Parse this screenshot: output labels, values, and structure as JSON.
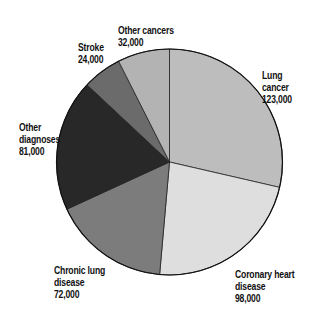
{
  "chart_data": {
    "type": "pie",
    "title": "",
    "start_angle_deg": 0,
    "direction": "clockwise",
    "total": 430000,
    "slices": [
      {
        "label": "Lung cancer",
        "value": 123000,
        "value_label": "123,000",
        "color": "#bdbdbd"
      },
      {
        "label": "Coronary heart disease",
        "value": 98000,
        "value_label": "98,000",
        "color": "#dedede"
      },
      {
        "label": "Chronic lung disease",
        "value": 72000,
        "value_label": "72,000",
        "color": "#7c7c7c"
      },
      {
        "label": "Other diagnoses",
        "value": 81000,
        "value_label": "81,000",
        "color": "#282828"
      },
      {
        "label": "Stroke",
        "value": 24000,
        "value_label": "24,000",
        "color": "#6b6b6b"
      },
      {
        "label": "Other cancers",
        "value": 32000,
        "value_label": "32,000",
        "color": "#b3b3b3"
      }
    ],
    "legend": "none (direct labels)"
  },
  "labels": {
    "lung_cancer": {
      "line1": "Lung cancer",
      "line2": "123,000"
    },
    "coronary": {
      "line1": "Coronary heart",
      "line2": "disease",
      "line3": "98,000"
    },
    "chronic_lung": {
      "line1": "Chronic lung",
      "line2": "disease",
      "line3": "72,000"
    },
    "other_diagnoses": {
      "line1": "Other",
      "line2": "diagnoses",
      "line3": "81,000"
    },
    "stroke": {
      "line1": "Stroke",
      "line2": "24,000"
    },
    "other_cancers": {
      "line1": "Other cancers",
      "line2": "32,000"
    }
  }
}
